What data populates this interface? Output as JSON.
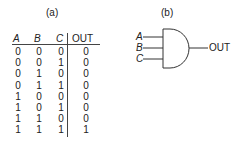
{
  "panel_a": {
    "caption": "(a)",
    "headers": [
      "A",
      "B",
      "C",
      "OUT"
    ],
    "rows": [
      [
        "0",
        "0",
        "0",
        "0"
      ],
      [
        "0",
        "0",
        "1",
        "0"
      ],
      [
        "0",
        "1",
        "0",
        "0"
      ],
      [
        "0",
        "1",
        "1",
        "0"
      ],
      [
        "1",
        "0",
        "0",
        "0"
      ],
      [
        "1",
        "0",
        "1",
        "0"
      ],
      [
        "1",
        "1",
        "0",
        "0"
      ],
      [
        "1",
        "1",
        "1",
        "1"
      ]
    ]
  },
  "panel_b": {
    "caption": "(b)",
    "gate_type": "AND",
    "inputs": [
      "A",
      "B",
      "C"
    ],
    "output": "OUT"
  }
}
